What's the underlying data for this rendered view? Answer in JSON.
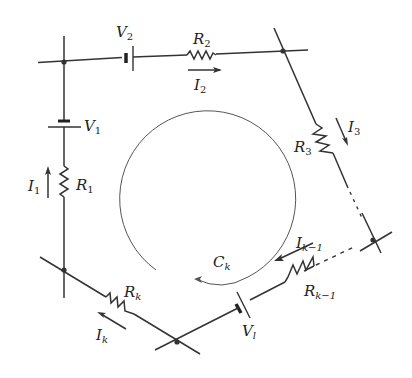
{
  "diagram": {
    "colors": {
      "wire": "#333333",
      "loop": "#555555",
      "background": "#ffffff"
    },
    "labels": {
      "V2": {
        "main": "V",
        "sub": "2"
      },
      "R2": {
        "main": "R",
        "sub": "2"
      },
      "I2": {
        "main": "I",
        "sub": "2"
      },
      "V1": {
        "main": "V",
        "sub": "1"
      },
      "R1": {
        "main": "R",
        "sub": "1"
      },
      "I1": {
        "main": "I",
        "sub": "1"
      },
      "R3": {
        "main": "R",
        "sub": "3"
      },
      "I3": {
        "main": "I",
        "sub": "3"
      },
      "Ck": {
        "main": "C",
        "sub": "k"
      },
      "Ik1": {
        "main": "I",
        "sub": "k−1"
      },
      "Rk1": {
        "main": "R",
        "sub": "k−1"
      },
      "Vl": {
        "main": "V",
        "sub": "l"
      },
      "Rk": {
        "main": "R",
        "sub": "k"
      },
      "Ik": {
        "main": "I",
        "sub": "k"
      }
    },
    "nodes": [
      "top-left",
      "top-right",
      "right",
      "bottom",
      "bottom-left"
    ]
  }
}
